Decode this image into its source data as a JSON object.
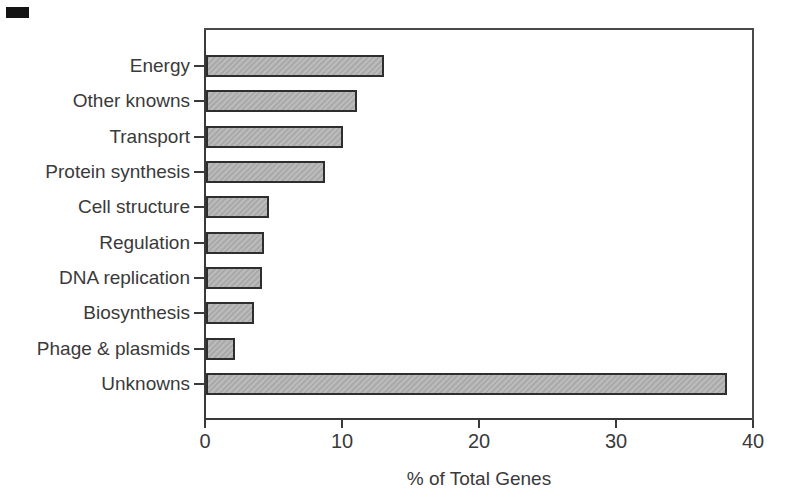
{
  "figure": {
    "background": "#ffffff",
    "scan_artifact": {
      "present": true
    }
  },
  "chart_data": {
    "type": "bar",
    "orientation": "horizontal",
    "title": "",
    "xlabel": "% of Total Genes",
    "ylabel": "",
    "categories": [
      "Energy",
      "Other knowns",
      "Transport",
      "Protein synthesis",
      "Cell structure",
      "Regulation",
      "DNA replication",
      "Biosynthesis",
      "Phage & plasmids",
      "Unknowns"
    ],
    "values": [
      13,
      11,
      10,
      8.7,
      4.6,
      4.2,
      4.1,
      3.5,
      2.1,
      38
    ],
    "xlim": [
      0,
      40
    ],
    "xticks": [
      0,
      10,
      20,
      30,
      40
    ],
    "grid": false,
    "legend": false,
    "colors": {
      "bar_fill": "#b7b7b7",
      "bar_border": "#2e2e2e",
      "axis": "#3a3a3a",
      "text": "#3a3a3a"
    }
  }
}
